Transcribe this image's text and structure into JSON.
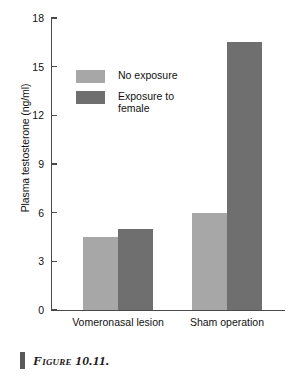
{
  "figure": {
    "caption": "Figure 10.11.",
    "caption_marker": "caption-bar-marker"
  },
  "legend": {
    "position": "inside-top-left",
    "items": [
      {
        "label": "No exposure",
        "color": "#a7a7a7"
      },
      {
        "label": "Exposure to\nfemale",
        "color": "#6f6f6f"
      }
    ]
  },
  "axis": {
    "y_title": "Plasma testosterone (ng/ml)",
    "y_ticks": [
      "0",
      "3",
      "6",
      "9",
      "12",
      "15",
      "18"
    ],
    "x_categories": [
      "Vomeronasal\nlesion",
      "Sham\noperation"
    ]
  },
  "chart_data": {
    "type": "bar",
    "title": "",
    "xlabel": "",
    "ylabel": "Plasma testosterone (ng/ml)",
    "ylim": [
      0,
      18
    ],
    "yticks": [
      0,
      3,
      6,
      9,
      12,
      15,
      18
    ],
    "grid": false,
    "legend_position": "upper left (inside axes)",
    "categories": [
      "Vomeronasal lesion",
      "Sham operation"
    ],
    "series": [
      {
        "name": "No exposure",
        "color": "#a7a7a7",
        "values": [
          4.5,
          6.0
        ]
      },
      {
        "name": "Exposure to female",
        "color": "#6f6f6f",
        "values": [
          5.0,
          16.5
        ]
      }
    ]
  }
}
